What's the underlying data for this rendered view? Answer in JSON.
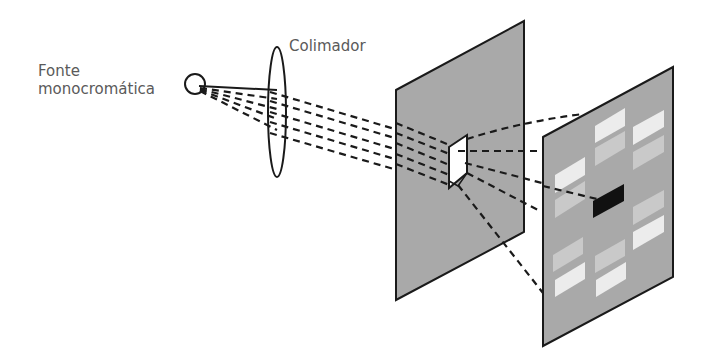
{
  "labels": {
    "source_line1": "Fonte",
    "source_line2": "monocromática",
    "collimator": "Colimador"
  },
  "icons": {
    "source": "light-source-circle-icon",
    "lens": "collimator-lens-icon",
    "crystal": "crystal-sample-icon",
    "detector": "detector-screen-icon"
  },
  "colors": {
    "text": "#5a5a5a",
    "line": "#1a1a1a",
    "panel_fill": "#a9a9a9",
    "crystal_fill": "#ffffff",
    "spot_light": "#ececec",
    "spot_medium": "#c9c9c9",
    "spot_dark": "#111111"
  },
  "diagram": {
    "elements": [
      "Fonte monocromática",
      "Colimador",
      "Cristal (anteparo)",
      "Tela detectora com padrão de difração"
    ],
    "diffraction_spots": {
      "total": 13,
      "dark_center": 1,
      "light": 6,
      "medium": 6
    }
  }
}
